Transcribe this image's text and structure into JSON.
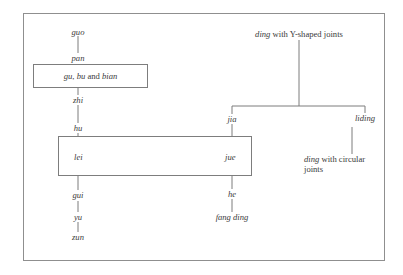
{
  "diagram": {
    "left_chain": {
      "top": "guo",
      "above_box": "pan",
      "box": {
        "term1": "gu",
        "sep1": ", ",
        "term2": "bu",
        "conj": " and ",
        "term3": "bian"
      },
      "below_box": "zhi",
      "above_main_box": "hu"
    },
    "main_box": {
      "left_label": "lei",
      "right_label": "jue"
    },
    "below_left": [
      "gui",
      "yu",
      "zun"
    ],
    "below_right": [
      "he",
      "fang ding"
    ],
    "right_tree": {
      "root": {
        "term": "ding",
        "rest": " with Y-shaped joints"
      },
      "branch_left": "jia",
      "branch_right": "liding",
      "leaf": {
        "term": "ding",
        "rest": " with circular",
        "line2": "joints"
      }
    }
  }
}
